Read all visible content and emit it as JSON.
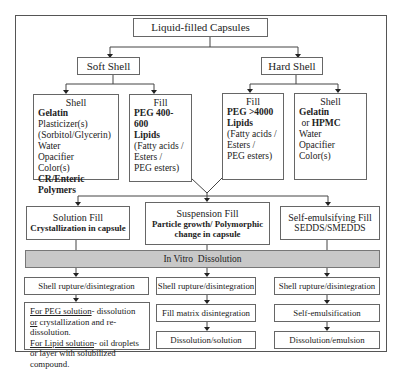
{
  "root": {
    "label": "Liquid-filled Capsules"
  },
  "soft_shell": {
    "label": "Soft Shell",
    "shell": {
      "title": "Shell",
      "items": [
        {
          "text": "Gelatin",
          "bold": true
        },
        {
          "text": "Plasticizer(s)",
          "bold": false
        },
        {
          "text": "(Sorbitol/Glycerin)",
          "bold": false
        },
        {
          "text": "Water",
          "bold": false
        },
        {
          "text": "Opacifier",
          "bold": false
        },
        {
          "text": "Color(s)",
          "bold": false
        },
        {
          "text": "CR/Enteric Polymers",
          "bold": true
        }
      ]
    },
    "fill": {
      "title": "Fill",
      "items": [
        {
          "text": "PEG 400-600",
          "bold": true
        },
        {
          "text": "Lipids",
          "bold": true
        },
        {
          "text": "(Fatty acids /",
          "bold": false
        },
        {
          "text": "Esters /",
          "bold": false
        },
        {
          "text": "PEG esters)",
          "bold": false
        }
      ]
    }
  },
  "hard_shell": {
    "label": "Hard Shell",
    "fill": {
      "title": "Fill",
      "items": [
        {
          "text": "PEG >4000",
          "bold": true
        },
        {
          "text": "Lipids",
          "bold": true
        },
        {
          "text": "(Fatty acids /",
          "bold": false
        },
        {
          "text": "Esters /",
          "bold": false
        },
        {
          "text": "PEG esters)",
          "bold": false
        }
      ]
    },
    "shell": {
      "title": "Shell",
      "line1_a": "Gelatin",
      "line1_or": " or ",
      "line1_b": "HPMC",
      "items": [
        "Water",
        "Opacifier",
        "Color(s)"
      ]
    }
  },
  "fill_types": [
    {
      "title": "Solution Fill",
      "subtitle": "Crystallization in capsule",
      "subtitle_bold": true
    },
    {
      "title": "Suspension Fill",
      "subtitle": "Particle growth/ Polymorphic change in capsule",
      "subtitle_bold": true
    },
    {
      "title": "Self-emulsifying Fill",
      "subtitle": "SEDDS/SMEDDS",
      "subtitle_bold": false
    }
  ],
  "dissolution_bar": {
    "label_left": "In Vitro",
    "label_right": "Dissolution",
    "color": "#c8c8c8"
  },
  "columns": {
    "solution": {
      "step1": "Shell rupture/disintegration",
      "desc": {
        "peg_label": "For PEG solution",
        "peg_text_1": "- dissolution ",
        "peg_or": "or",
        "peg_text_2": " crystallization and re-dissolution.",
        "lipid_label": "For Lipid solution",
        "lipid_text": "- oil droplets or layer with solubilized compound."
      }
    },
    "suspension": {
      "step1": "Shell rupture/disintegration",
      "step2": "Fill matrix disintegration",
      "step3": "Dissolution/solution"
    },
    "self_emulsifying": {
      "step1": "Shell rupture/disintegration",
      "step2": "Self-emulsification",
      "step3": "Dissolution/emulsion"
    }
  }
}
